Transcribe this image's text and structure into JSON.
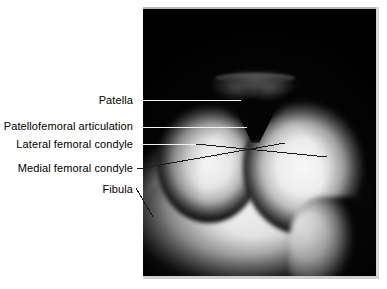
{
  "figure": {
    "type": "annotated-radiograph",
    "view": "skyline (sunrise) patellofemoral knee radiograph",
    "background_color": "#ffffff",
    "plate_color": "#050505",
    "leader_line_color": "#ffffff",
    "label_text_color": "#000000"
  },
  "labels": [
    {
      "id": "patella",
      "text": "Patella",
      "text_right_px": 133,
      "text_top_px": 94,
      "leader": {
        "x1": 137,
        "y1": 100,
        "x2": 241,
        "y2": 100,
        "color": "#f2f2f2"
      }
    },
    {
      "id": "patellofemoral-articulation",
      "text": "Patellofemoral articulation",
      "text_right_px": 133,
      "text_top_px": 120,
      "leader": {
        "x1": 137,
        "y1": 127,
        "x2": 247,
        "y2": 127,
        "color": "#f2f2f2"
      }
    },
    {
      "id": "lateral-femoral-condyle",
      "text": "Lateral femoral condyle",
      "text_right_px": 133,
      "text_top_px": 138,
      "leader": {
        "x1": 137,
        "y1": 144,
        "x2": 196,
        "y2": 144,
        "color": "#f2f2f2"
      }
    },
    {
      "id": "lateral-femoral-condyle-diagonal",
      "text": "",
      "leader": {
        "x1": 196,
        "y1": 144,
        "x2": 327,
        "y2": 157,
        "color": "#1a1a1a"
      }
    },
    {
      "id": "medial-femoral-condyle",
      "text": "Medial femoral condyle",
      "text_right_px": 133,
      "text_top_px": 162,
      "leader": {
        "x1": 137,
        "y1": 169,
        "x2": 285,
        "y2": 143,
        "color": "#1a1a1a"
      }
    },
    {
      "id": "fibula",
      "text": "Fibula",
      "text_right_px": 133,
      "text_top_px": 183,
      "leader": {
        "x1": 136,
        "y1": 188,
        "x2": 153,
        "y2": 217,
        "color": "#1a1a1a"
      }
    }
  ]
}
